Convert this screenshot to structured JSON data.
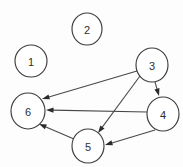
{
  "diagram": {
    "type": "directed-graph",
    "width": 183,
    "height": 167,
    "background_color": "#fdfdfd",
    "node_fill": "#ffffff",
    "node_stroke": "#3d3d3d",
    "edge_color": "#484848",
    "arrowhead_color": "#2b2b2b",
    "label_color": "#2e2e2e",
    "nodes": [
      {
        "id": "1",
        "label": "1",
        "cx": 31,
        "cy": 61,
        "rx": 16,
        "ry": 16
      },
      {
        "id": "2",
        "label": "2",
        "cx": 87,
        "cy": 29,
        "rx": 15,
        "ry": 16
      },
      {
        "id": "3",
        "label": "3",
        "cx": 152,
        "cy": 65,
        "rx": 16,
        "ry": 17
      },
      {
        "id": "4",
        "label": "4",
        "cx": 163,
        "cy": 114,
        "rx": 16,
        "ry": 17
      },
      {
        "id": "5",
        "label": "5",
        "cx": 88,
        "cy": 146,
        "rx": 16,
        "ry": 17
      },
      {
        "id": "6",
        "label": "6",
        "cx": 28,
        "cy": 111,
        "rx": 17,
        "ry": 18
      }
    ],
    "edges": [
      {
        "id": "e-3-6",
        "from": "3",
        "to": "6",
        "x1": 137,
        "y1": 71,
        "x2": 42,
        "y2": 99,
        "directed": true
      },
      {
        "id": "e-3-5",
        "from": "3",
        "to": "5",
        "x1": 140,
        "y1": 76,
        "x2": 98,
        "y2": 133,
        "directed": true
      },
      {
        "id": "e-3-4",
        "from": "3",
        "to": "4",
        "x1": 155,
        "y1": 82,
        "x2": 159,
        "y2": 96,
        "directed": true
      },
      {
        "id": "e-4-6",
        "from": "4",
        "to": "6",
        "x1": 147,
        "y1": 112,
        "x2": 46,
        "y2": 110,
        "directed": true
      },
      {
        "id": "e-4-5",
        "from": "4",
        "to": "5",
        "x1": 155,
        "y1": 130,
        "x2": 105,
        "y2": 145,
        "directed": true
      },
      {
        "id": "e-5-6",
        "from": "5",
        "to": "6",
        "x1": 74,
        "y1": 139,
        "x2": 39,
        "y2": 124,
        "directed": true
      }
    ]
  }
}
